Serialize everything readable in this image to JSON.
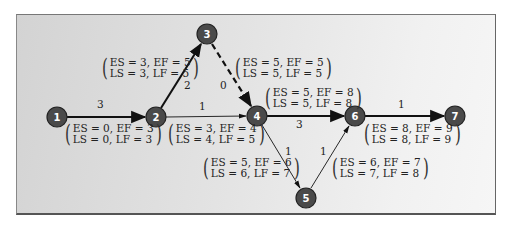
{
  "colors": {
    "node_fill": "#4a4a4a",
    "node_stroke": "#222222",
    "edge": "#111111",
    "panel_border": "#666666"
  },
  "nodes": [
    {
      "id": "1",
      "x": 57,
      "y": 117
    },
    {
      "id": "2",
      "x": 156,
      "y": 117
    },
    {
      "id": "3",
      "x": 207,
      "y": 34
    },
    {
      "id": "4",
      "x": 257,
      "y": 116
    },
    {
      "id": "5",
      "x": 306,
      "y": 198
    },
    {
      "id": "6",
      "x": 355,
      "y": 116
    },
    {
      "id": "7",
      "x": 455,
      "y": 116
    }
  ],
  "edges": [
    {
      "from": "1",
      "to": "2",
      "weight": "3",
      "critical": true,
      "dashed": false
    },
    {
      "from": "2",
      "to": "3",
      "weight": "2",
      "critical": true,
      "dashed": false
    },
    {
      "from": "3",
      "to": "4",
      "weight": "0",
      "critical": true,
      "dashed": true
    },
    {
      "from": "2",
      "to": "4",
      "weight": "1",
      "critical": false,
      "dashed": false
    },
    {
      "from": "4",
      "to": "6",
      "weight": "3",
      "critical": true,
      "dashed": false
    },
    {
      "from": "4",
      "to": "5",
      "weight": "1",
      "critical": false,
      "dashed": false
    },
    {
      "from": "5",
      "to": "6",
      "weight": "1",
      "critical": false,
      "dashed": false
    },
    {
      "from": "6",
      "to": "7",
      "weight": "1",
      "critical": true,
      "dashed": false
    }
  ],
  "activity_labels": {
    "a12": {
      "line1": "ES = 0, EF = 3",
      "line2": "LS = 0, LF = 3"
    },
    "a23": {
      "line1": "ES = 3, EF = 5",
      "line2": "LS = 3, LF = 5"
    },
    "a34": {
      "line1": "ES = 5, EF = 5",
      "line2": "LS = 5, LF = 5"
    },
    "a24": {
      "line1": "ES = 3, EF = 4",
      "line2": "LS = 4, LF = 5"
    },
    "a46": {
      "line1": "ES = 5, EF = 8",
      "line2": "LS = 5, LF = 8"
    },
    "a45": {
      "line1": "ES = 5, EF = 6",
      "line2": "LS = 6, LF = 7"
    },
    "a56": {
      "line1": "ES = 6, EF = 7",
      "line2": "LS = 7, LF = 8"
    },
    "a67": {
      "line1": "ES = 8, EF = 9",
      "line2": "LS = 8, LF = 9"
    }
  },
  "weights": {
    "w12": "3",
    "w23": "2",
    "w34": "0",
    "w24": "1",
    "w46": "3",
    "w45": "1",
    "w56": "1",
    "w67": "1"
  }
}
